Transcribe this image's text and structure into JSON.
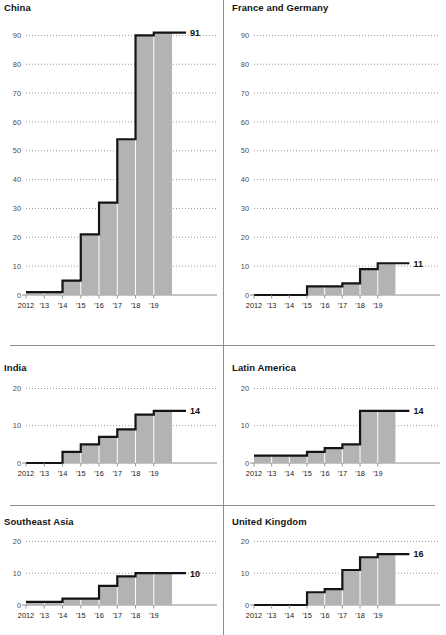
{
  "figure": {
    "divider_color": "#8c8c8c",
    "fill_color": "#b3b3b3",
    "line_color": "#141414",
    "grid_color": "#808080",
    "axis_color": "#8c8c8c"
  },
  "chart_data": [
    {
      "type": "area",
      "title": "China",
      "x": [
        "2012",
        "'13",
        "'14",
        "'15",
        "'16",
        "'17",
        "'18",
        "'19"
      ],
      "values": [
        1,
        1,
        5,
        21,
        32,
        54,
        90,
        91
      ],
      "end_label": "91",
      "yticks": [
        0,
        10,
        20,
        30,
        40,
        50,
        60,
        70,
        80,
        90
      ],
      "ylim": [
        0,
        95
      ],
      "xlabel": "",
      "ylabel": "",
      "grid": true,
      "legend": "none"
    },
    {
      "type": "area",
      "title": "France and Germany",
      "x": [
        "2012",
        "'13",
        "'14",
        "'15",
        "'16",
        "'17",
        "'18",
        "'19"
      ],
      "values": [
        0,
        0,
        0,
        3,
        3,
        4,
        9,
        11
      ],
      "end_label": "11",
      "yticks": [
        0,
        10,
        20,
        30,
        40,
        50,
        60,
        70,
        80,
        90
      ],
      "ylim": [
        0,
        95
      ],
      "xlabel": "",
      "ylabel": "",
      "grid": true,
      "legend": "none"
    },
    {
      "type": "area",
      "title": "India",
      "x": [
        "2012",
        "'13",
        "'14",
        "'15",
        "'16",
        "'17",
        "'18",
        "'19"
      ],
      "values": [
        0,
        0,
        3,
        5,
        7,
        9,
        13,
        14
      ],
      "end_label": "14",
      "yticks": [
        0,
        10,
        20
      ],
      "ylim": [
        0,
        22
      ],
      "xlabel": "",
      "ylabel": "",
      "grid": true,
      "legend": "none"
    },
    {
      "type": "area",
      "title": "Latin America",
      "x": [
        "2012",
        "'13",
        "'14",
        "'15",
        "'16",
        "'17",
        "'18",
        "'19"
      ],
      "values": [
        2,
        2,
        2,
        3,
        4,
        5,
        14,
        14
      ],
      "end_label": "14",
      "yticks": [
        0,
        10,
        20
      ],
      "ylim": [
        0,
        22
      ],
      "xlabel": "",
      "ylabel": "",
      "grid": true,
      "legend": "none"
    },
    {
      "type": "area",
      "title": "Southeast Asia",
      "x": [
        "2012",
        "'13",
        "'14",
        "'15",
        "'16",
        "'17",
        "'18",
        "'19"
      ],
      "values": [
        1,
        1,
        2,
        2,
        6,
        9,
        10,
        10
      ],
      "end_label": "10",
      "yticks": [
        0,
        10,
        20
      ],
      "ylim": [
        0,
        22
      ],
      "xlabel": "",
      "ylabel": "",
      "grid": true,
      "legend": "none"
    },
    {
      "type": "area",
      "title": "United Kingdom",
      "x": [
        "2012",
        "'13",
        "'14",
        "'15",
        "'16",
        "'17",
        "'18",
        "'19"
      ],
      "values": [
        0,
        0,
        0,
        4,
        5,
        11,
        15,
        16
      ],
      "end_label": "16",
      "yticks": [
        0,
        10,
        20
      ],
      "ylim": [
        0,
        22
      ],
      "xlabel": "",
      "ylabel": "",
      "grid": true,
      "legend": "none"
    }
  ]
}
